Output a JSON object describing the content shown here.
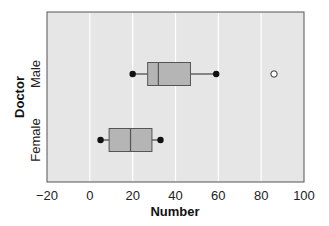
{
  "chart_data": {
    "type": "boxplot",
    "orientation": "horizontal",
    "title": "",
    "xlabel": "Number",
    "ylabel": "Doctor",
    "xlim": [
      -20,
      100
    ],
    "x_ticks": [
      -20,
      0,
      20,
      40,
      60,
      80,
      100
    ],
    "x_tick_labels": [
      "−20",
      "0",
      "20",
      "40",
      "60",
      "80",
      "100"
    ],
    "grid": "vertical gridlines at each tick (white)",
    "categories": [
      "Male",
      "Female"
    ],
    "series": [
      {
        "name": "Male",
        "whisker_low": 20,
        "q1": 27,
        "median": 32,
        "q3": 47,
        "whisker_high": 59,
        "outliers": [
          86
        ]
      },
      {
        "name": "Female",
        "whisker_low": 5,
        "q1": 9,
        "median": 19,
        "q3": 29,
        "whisker_high": 33,
        "outliers": []
      }
    ],
    "colors": {
      "plot_background": "#e6e6e6",
      "box_fill": "#b5b5b5",
      "box_edge": "#555555",
      "gridline": "#ffffff"
    }
  }
}
